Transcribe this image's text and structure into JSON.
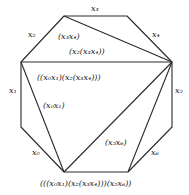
{
  "diagram": {
    "type": "polygon-triangulation",
    "edge_labels": {
      "x0": "x₀",
      "x1": "x₁",
      "x2": "x₂",
      "x3": "x₃",
      "x4": "x₄",
      "x5": "x₅",
      "x6": "x₆"
    },
    "region_labels": {
      "r_x3x4": "(x₃x₄)",
      "r_x2x3x4": "(x₂(x₃x₄))",
      "r_big": "((x₀x₁)(x₂(x₃x₄)))",
      "r_x0x1": "(x₀x₁)",
      "r_x5x6": "(x₅x₆)"
    },
    "root_label": "(((x₀x₁)(x₂(x₃x₄)))(x₅x₆))",
    "stroke_color": "#2a2a2a"
  }
}
